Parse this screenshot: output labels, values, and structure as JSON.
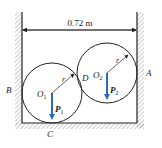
{
  "diagram": {
    "dimension_label": "0.72 m",
    "points": {
      "A": "A",
      "B": "B",
      "C": "C",
      "D": "D"
    },
    "circle1": {
      "center_label": "O",
      "center_sub": "1",
      "radius_label": "r",
      "force_label": "P",
      "force_sub": "1"
    },
    "circle2": {
      "center_label": "O",
      "center_sub": "2",
      "radius_label": "r",
      "force_label": "P",
      "force_sub": "2"
    },
    "colors": {
      "line": "#222222",
      "force_arrow": "#2a6db5",
      "hatch": "#9a9a9a"
    }
  }
}
